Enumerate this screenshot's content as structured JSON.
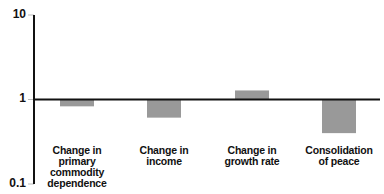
{
  "chart_data": {
    "type": "bar",
    "title": "",
    "xlabel": "",
    "ylabel": "",
    "yscale": "log",
    "ylim": [
      0.1,
      10
    ],
    "yticks": [
      "10",
      "1",
      "0.1"
    ],
    "baseline": 1,
    "grid": false,
    "legend": null,
    "categories": [
      "Change in primary commodity dependence",
      "Change in income",
      "Change in growth rate",
      "Consolidation of peace"
    ],
    "category_lines": [
      [
        "Change in",
        "primary",
        "commodity",
        "dependence"
      ],
      [
        "Change in",
        "income"
      ],
      [
        "Change in",
        "growth rate"
      ],
      [
        "Consolidation",
        "of peace"
      ]
    ],
    "values": [
      0.83,
      0.61,
      1.28,
      0.4
    ],
    "bar_color": "#999999",
    "axis_color": "#111111"
  }
}
